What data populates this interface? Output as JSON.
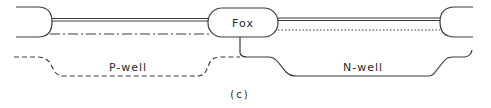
{
  "diagram": {
    "caption": "(c)",
    "labels": {
      "fox": "Fox",
      "p_well": "P-well",
      "n_well": "N-well"
    },
    "colors": {
      "stroke": "#3a3a3a",
      "background": "#ffffff"
    },
    "elements": [
      {
        "name": "left-field-oxide",
        "type": "rounded-edge"
      },
      {
        "name": "left-gate-double-line",
        "type": "double-line"
      },
      {
        "name": "left-dash-dot-line",
        "type": "dash-dot-line"
      },
      {
        "name": "center-field-oxide",
        "type": "rounded-rect",
        "label": "Fox"
      },
      {
        "name": "right-gate-double-line",
        "type": "double-line"
      },
      {
        "name": "right-dotted-line",
        "type": "dotted-line"
      },
      {
        "name": "right-field-oxide",
        "type": "rounded-edge"
      },
      {
        "name": "p-well-boundary",
        "type": "dashed-curve",
        "label": "P-well"
      },
      {
        "name": "n-well-boundary",
        "type": "solid-curve",
        "label": "N-well"
      }
    ]
  }
}
